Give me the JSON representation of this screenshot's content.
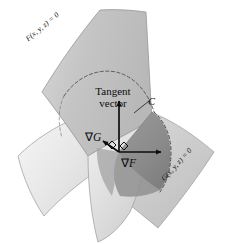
{
  "figure": {
    "background_color": "#ffffff",
    "width": 235,
    "height": 244
  },
  "labels": {
    "surface_f": "F(x, y, z) = 0",
    "surface_g": "G(x, y, z) = 0",
    "tangent_line1": "Tangent",
    "tangent_line2": "vector",
    "gradient_g_symbol": "∇",
    "gradient_g_name": "G",
    "gradient_f_symbol": "∇",
    "gradient_f_name": "F",
    "curve": "C"
  },
  "colors": {
    "surface_f_fill": "#c6c6c6",
    "surface_f_light": "#e3e3e3",
    "surface_g_fill": "#d2d2d2",
    "surface_g_light": "#ededed",
    "intersection_fill": "#8f8f8f",
    "intersection_dark": "#848484",
    "outline": "#6e6e6e",
    "dashed_curve": "#4a4a4a",
    "vector_stroke": "#0d0d0d",
    "text": "#0d0d0d",
    "background": "#ffffff"
  },
  "geometry": {
    "origin_point": {
      "x": 119,
      "y": 152
    },
    "tangent_vector_tip": {
      "x": 119,
      "y": 100
    },
    "gradient_f_tip": {
      "x": 163,
      "y": 152
    },
    "gradient_g_tip": {
      "x": 101,
      "y": 140
    },
    "right_angle_marks": 2
  },
  "elements": {
    "surface_f_name": "surface-f",
    "surface_g_name": "surface-g",
    "intersection_name": "intersection-region",
    "curve_name": "intersection-curve-c"
  }
}
